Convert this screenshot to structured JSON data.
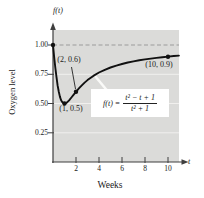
{
  "chart_data": {
    "type": "line",
    "title": "",
    "xlabel": "Weeks",
    "ylabel": "Oxygen level",
    "x_axis_symbol": "t",
    "y_axis_symbol": "f(t)",
    "xlim": [
      0,
      11
    ],
    "ylim": [
      0,
      1.15
    ],
    "grid": true,
    "legend": "none",
    "x_ticks": [
      2,
      4,
      6,
      8,
      10
    ],
    "x_tick_labels": [
      "2",
      "4",
      "6",
      "8",
      "10"
    ],
    "y_ticks": [
      1.0,
      0.75,
      0.5,
      0.25
    ],
    "y_tick_labels": [
      "1.00",
      "0.75",
      "0.50",
      "0.25"
    ],
    "grid_y_values": [
      0.25,
      0.5,
      0.75
    ],
    "asymptote_y": 1.0,
    "formula": {
      "lhs": "f(t) =",
      "numerator": "t² − t + 1",
      "denominator": "t² + 1"
    },
    "marked_points": [
      {
        "t": 0,
        "f": 1.0,
        "label": ""
      },
      {
        "t": 1,
        "f": 0.5,
        "label": "(1, 0.5)"
      },
      {
        "t": 2,
        "f": 0.6,
        "label": "(2, 0.6)"
      },
      {
        "t": 10,
        "f": 0.9,
        "label": "(10, 0.9)"
      }
    ],
    "curve": {
      "t": [
        0,
        0.1,
        0.2,
        0.3,
        0.4,
        0.5,
        0.6,
        0.7,
        0.8,
        0.9,
        1,
        1.1,
        1.2,
        1.4,
        1.6,
        1.8,
        2,
        2.25,
        2.5,
        2.75,
        3,
        3.5,
        4,
        4.5,
        5,
        5.5,
        6,
        6.5,
        7,
        7.5,
        8,
        8.5,
        9,
        9.5,
        10,
        10.5,
        10.95
      ],
      "f": [
        1,
        0.901,
        0.808,
        0.725,
        0.655,
        0.6,
        0.559,
        0.53,
        0.512,
        0.503,
        0.5,
        0.502,
        0.508,
        0.527,
        0.551,
        0.576,
        0.6,
        0.629,
        0.655,
        0.679,
        0.7,
        0.736,
        0.765,
        0.788,
        0.808,
        0.824,
        0.838,
        0.85,
        0.86,
        0.869,
        0.877,
        0.884,
        0.89,
        0.896,
        0.901,
        0.906,
        0.909
      ]
    }
  },
  "colors": {
    "plot_bg": "#dbdbd9",
    "grid": "#f1f0ee",
    "asymptote": "#9b9b9b",
    "axis": "#3f3f3f",
    "curve": "#111111",
    "text": "#1a1a1a",
    "formula_bg": "#ffffff",
    "formula_leader": "#fafaf8"
  }
}
